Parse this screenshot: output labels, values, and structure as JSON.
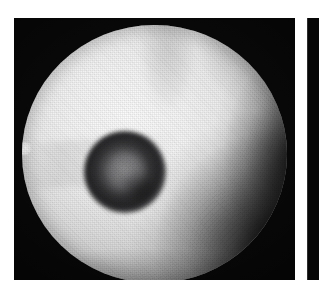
{
  "figure": {
    "kind": "endoscopic-photograph",
    "modality": "white-light endoscopy",
    "caption": "",
    "background_color": "#ffffff",
    "panel_color": "#000000"
  },
  "panels": [
    {
      "id": "panel-main",
      "label": "",
      "x": 14,
      "y": 18,
      "width": 281,
      "height": 262,
      "frame_color": "#050505",
      "content": {
        "field_of_view": {
          "shape": "circle",
          "center_x": 140,
          "center_y": 136,
          "radius": 131,
          "base_color": "#f5f5f5",
          "description": "bright circular endoscopic field of view with fine halftone weave texture"
        },
        "features": [
          {
            "name": "ring-lesion",
            "shape": "annular",
            "center_x": 182,
            "center_y": 166,
            "outer_radius": 41,
            "inner_radius": 19,
            "ring_color": "#1c1c1e",
            "core_color": "#bebec0",
            "description": "dark ring-shaped lesion with slightly brighter central crater"
          },
          {
            "name": "right-flank-shadow",
            "shape": "gradient",
            "center_x": 272,
            "center_y": 134,
            "color": "#000000",
            "description": "shadowed mucosal fold along the right rim"
          },
          {
            "name": "bottom-right-shadow",
            "shape": "gradient",
            "center_x": 276,
            "center_y": 227,
            "color": "#000000",
            "description": "broad dark shadow occupying the lower-right quadrant"
          },
          {
            "name": "top-center-band",
            "shape": "band",
            "center_x": 140,
            "center_y": 52,
            "color": "#5a5a5f",
            "description": "faint grey vertical band descending from the upper rim"
          },
          {
            "name": "left-rim-notch",
            "shape": "protrusion",
            "center_x": 10,
            "center_y": 130,
            "color": "#dcdcdc",
            "description": "small bright notch on the left edge of the circular field"
          },
          {
            "name": "specular-sheen",
            "shape": "gradient",
            "center_x": 132,
            "center_y": 167,
            "color": "#ffffff",
            "description": "bright specular highlight immediately left of the lesion"
          }
        ]
      }
    },
    {
      "id": "panel-secondary",
      "label": "",
      "x": 307,
      "y": 18,
      "width": 12,
      "height": 262,
      "frame_color": "#060606",
      "content": {
        "description": "left-hand sliver of an adjacent figure panel, cropped at the page edge"
      }
    }
  ],
  "colors": {
    "page_background": "#ffffff",
    "panel_frame": "#000000",
    "mucosa_bright": "#f7f7f7",
    "mucosa_mid": "#dedede",
    "lesion_ring": "#1c1c1e",
    "lesion_core": "#bebec0",
    "shadow": "#000000"
  }
}
